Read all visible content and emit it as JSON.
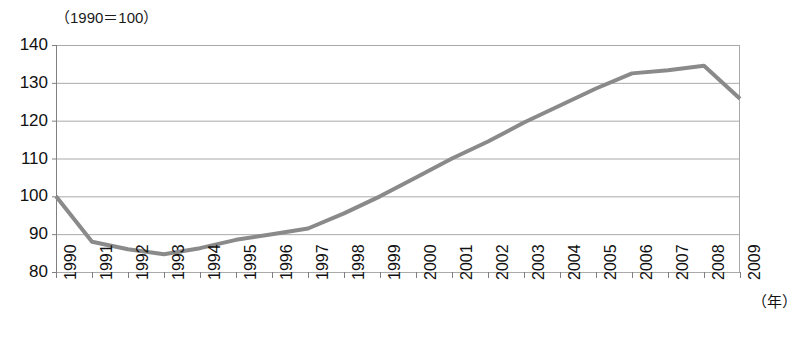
{
  "chart": {
    "unit_title": "（1990＝100）",
    "xaxis_unit": "（年）",
    "footnote": ""
  },
  "chart_data": {
    "type": "line",
    "title": "（1990＝100）",
    "xlabel": "（年）",
    "ylabel": "",
    "categories": [
      "1990",
      "1991",
      "1992",
      "1993",
      "1994",
      "1995",
      "1996",
      "1997",
      "1998",
      "1999",
      "2000",
      "2001",
      "2002",
      "2003",
      "2004",
      "2005",
      "2006",
      "2007",
      "2008",
      "2009"
    ],
    "values": [
      100.0,
      88.0,
      86.0,
      84.7,
      86.3,
      88.5,
      90.0,
      91.5,
      95.5,
      100.0,
      105.0,
      110.0,
      114.5,
      119.5,
      124.0,
      128.5,
      132.5,
      133.3,
      134.5,
      125.8
    ],
    "ylim": [
      80,
      140
    ],
    "ytick_values": [
      80,
      90,
      100,
      110,
      120,
      130,
      140
    ],
    "ytick_labels": [
      "80",
      "90",
      "100",
      "110",
      "120",
      "130",
      "140"
    ],
    "grid": true,
    "legend": "none",
    "series_color": "#8a8a8a",
    "grid_color": "#a9a9a9",
    "axis_color": "#808080"
  }
}
